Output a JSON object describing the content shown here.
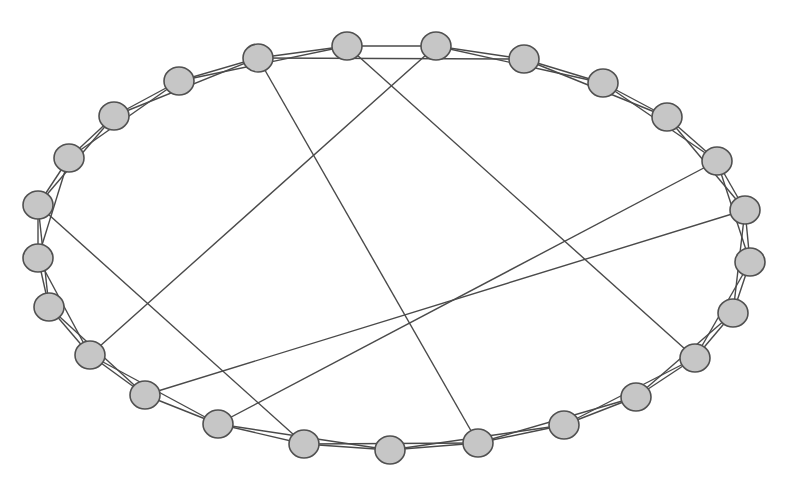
{
  "diagram": {
    "type": "network-graph",
    "layout": "circular-ellipse",
    "colors": {
      "node_fill": "#c6c6c6",
      "node_stroke": "#505050",
      "edge": "#4a4a4a",
      "background": "#ffffff"
    },
    "node_radius": {
      "rx": 15,
      "ry": 14
    },
    "nodes": [
      {
        "id": 0,
        "x": 258,
        "y": 58
      },
      {
        "id": 1,
        "x": 347,
        "y": 46
      },
      {
        "id": 2,
        "x": 436,
        "y": 46
      },
      {
        "id": 3,
        "x": 524,
        "y": 59
      },
      {
        "id": 4,
        "x": 603,
        "y": 83
      },
      {
        "id": 5,
        "x": 667,
        "y": 117
      },
      {
        "id": 6,
        "x": 717,
        "y": 161
      },
      {
        "id": 7,
        "x": 745,
        "y": 210
      },
      {
        "id": 8,
        "x": 750,
        "y": 262
      },
      {
        "id": 9,
        "x": 733,
        "y": 313
      },
      {
        "id": 10,
        "x": 695,
        "y": 358
      },
      {
        "id": 11,
        "x": 636,
        "y": 397
      },
      {
        "id": 12,
        "x": 564,
        "y": 425
      },
      {
        "id": 13,
        "x": 478,
        "y": 443
      },
      {
        "id": 14,
        "x": 390,
        "y": 450
      },
      {
        "id": 15,
        "x": 304,
        "y": 444
      },
      {
        "id": 16,
        "x": 218,
        "y": 424
      },
      {
        "id": 17,
        "x": 145,
        "y": 395
      },
      {
        "id": 18,
        "x": 90,
        "y": 355
      },
      {
        "id": 19,
        "x": 49,
        "y": 307
      },
      {
        "id": 20,
        "x": 38,
        "y": 258
      },
      {
        "id": 21,
        "x": 38,
        "y": 205
      },
      {
        "id": 22,
        "x": 69,
        "y": 158
      },
      {
        "id": 23,
        "x": 114,
        "y": 116
      },
      {
        "id": 24,
        "x": 179,
        "y": 81
      }
    ],
    "edges": [
      [
        0,
        1
      ],
      [
        1,
        2
      ],
      [
        2,
        3
      ],
      [
        3,
        4
      ],
      [
        4,
        5
      ],
      [
        5,
        6
      ],
      [
        6,
        7
      ],
      [
        7,
        8
      ],
      [
        8,
        9
      ],
      [
        9,
        10
      ],
      [
        10,
        11
      ],
      [
        11,
        12
      ],
      [
        12,
        13
      ],
      [
        13,
        14
      ],
      [
        14,
        15
      ],
      [
        15,
        16
      ],
      [
        16,
        17
      ],
      [
        17,
        18
      ],
      [
        18,
        19
      ],
      [
        19,
        20
      ],
      [
        20,
        21
      ],
      [
        21,
        22
      ],
      [
        22,
        23
      ],
      [
        23,
        24
      ],
      [
        24,
        0
      ],
      [
        0,
        3
      ],
      [
        2,
        4
      ],
      [
        3,
        5
      ],
      [
        4,
        6
      ],
      [
        5,
        7
      ],
      [
        6,
        8
      ],
      [
        7,
        9
      ],
      [
        8,
        10
      ],
      [
        9,
        11
      ],
      [
        10,
        12
      ],
      [
        11,
        13
      ],
      [
        12,
        14
      ],
      [
        13,
        15
      ],
      [
        14,
        16
      ],
      [
        16,
        18
      ],
      [
        17,
        19
      ],
      [
        18,
        20
      ],
      [
        19,
        21
      ],
      [
        20,
        22
      ],
      [
        21,
        23
      ],
      [
        22,
        24
      ],
      [
        23,
        0
      ],
      [
        24,
        1
      ],
      [
        0,
        13
      ],
      [
        1,
        10
      ],
      [
        2,
        18
      ],
      [
        6,
        16
      ],
      [
        7,
        17
      ],
      [
        21,
        15
      ]
    ]
  }
}
